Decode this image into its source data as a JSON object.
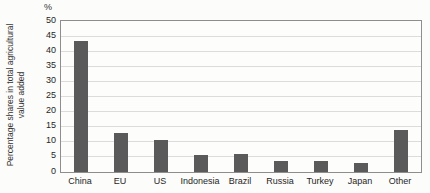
{
  "chart_data": {
    "type": "bar",
    "title": "",
    "unit_label": "%",
    "ylabel": "Percentage shares in total agricultural value added",
    "ylabel_lines": [
      "Percentage shares in total agricultural",
      "value added"
    ],
    "categories": [
      "China",
      "EU",
      "US",
      "Indonesia",
      "Brazil",
      "Russia",
      "Turkey",
      "Japan",
      "Other"
    ],
    "values": [
      43.3,
      12.9,
      10.7,
      5.7,
      5.8,
      3.6,
      3.7,
      2.9,
      13.9
    ],
    "ylim": [
      0,
      50
    ],
    "ytick_step": 5,
    "grid": true,
    "legend": "none",
    "bar_color": "#5a5a5a",
    "gridline_color": "#dcdcdc",
    "axis_border_color": "#8e8e8e"
  }
}
